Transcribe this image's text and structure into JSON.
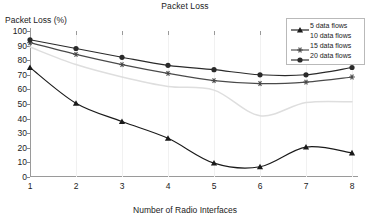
{
  "chart_data": {
    "type": "line",
    "title": "Packet Loss",
    "xlabel": "Number of Radio Interfaces",
    "ylabel": "Packet Loss (%)",
    "x": [
      1,
      2,
      3,
      4,
      5,
      6,
      7,
      8
    ],
    "xlim": [
      1,
      8
    ],
    "ylim": [
      0,
      100
    ],
    "ytick_labels": [
      "0",
      "10",
      "20",
      "30",
      "40",
      "50",
      "60",
      "70",
      "80",
      "90",
      "100"
    ],
    "ytick_values": [
      0,
      10,
      20,
      30,
      40,
      50,
      60,
      70,
      80,
      90,
      100
    ],
    "xtick_labels": [
      "1",
      "2",
      "3",
      "4",
      "5",
      "6",
      "7",
      "8"
    ],
    "grid": "vertical-light",
    "legend_position": "top-right",
    "series": [
      {
        "name": "5 data flows",
        "values": [
          75,
          50.5,
          38,
          26.5,
          9.5,
          7,
          20.5,
          16.5
        ],
        "color": "#1a1a1a",
        "marker": "triangle"
      },
      {
        "name": "10 data flows",
        "values": [
          89,
          77,
          68.5,
          62,
          59.5,
          42,
          51,
          51.5
        ],
        "color": "#dedede",
        "marker": "none"
      },
      {
        "name": "15 data flows",
        "values": [
          92,
          84,
          77,
          71,
          66,
          64,
          65,
          68.5
        ],
        "color": "#4a4a4a",
        "marker": "asterisk"
      },
      {
        "name": "20 data flows",
        "values": [
          94,
          88,
          82,
          76.5,
          73.5,
          70,
          70,
          75
        ],
        "color": "#2a2a2a",
        "marker": "circle"
      }
    ]
  }
}
